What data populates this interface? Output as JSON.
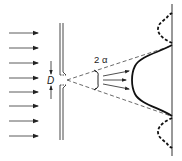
{
  "figure": {
    "labels": {
      "slit_width": "D",
      "angle": "2 α"
    },
    "incident_arrows": {
      "count": 8,
      "y_positions": [
        33,
        48,
        63,
        78,
        90,
        105,
        118,
        133
      ]
    },
    "elements": {
      "incident_wave": "parallel-arrows",
      "slit": "barrier-with-opening",
      "screen": "vertical-line",
      "central_maximum": "solid-intensity-curve",
      "side_maxima": "dashed-intensity-curves",
      "divergence_cone": "dashed-lines"
    },
    "colors": {
      "stroke": "#222222",
      "background": "#ffffff"
    }
  }
}
